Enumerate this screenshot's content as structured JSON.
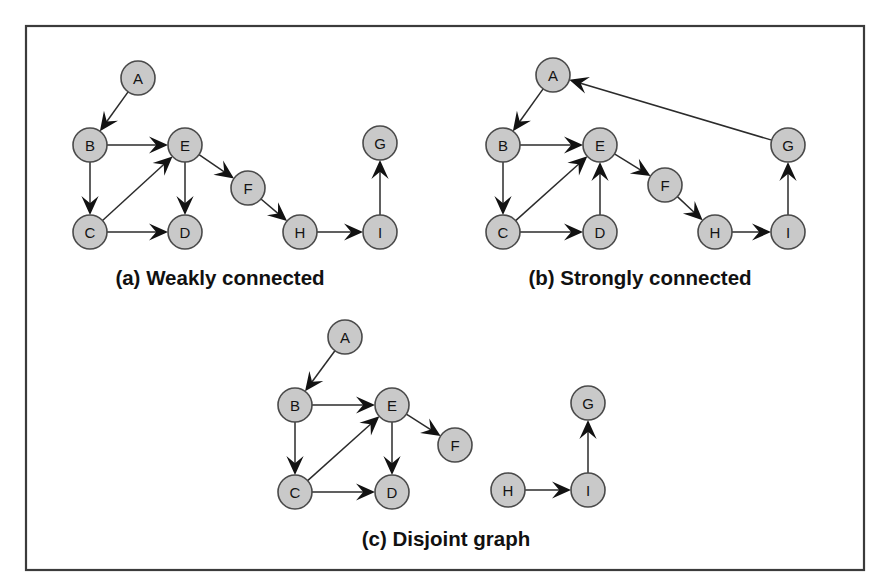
{
  "figure": {
    "kind": "directed-graph-figure",
    "background_color": "#ffffff",
    "frame": {
      "stroke_color": "#3b3b3b",
      "x": 26,
      "y": 26,
      "width": 838,
      "height": 544
    },
    "node_style": {
      "fill_color": "#c9c9c9",
      "stroke_color": "#4a4a4a",
      "radius": 17
    },
    "edge_style": {
      "stroke_color": "#2b2b2b",
      "arrow_fill": "#121212"
    },
    "panels": [
      {
        "id": "panel-a",
        "caption": "(a) Weakly connected",
        "caption_x": 220,
        "caption_y": 285,
        "nodes": [
          {
            "label": "A",
            "x": 138,
            "y": 78
          },
          {
            "label": "B",
            "x": 90,
            "y": 145
          },
          {
            "label": "C",
            "x": 90,
            "y": 232
          },
          {
            "label": "D",
            "x": 185,
            "y": 232
          },
          {
            "label": "E",
            "x": 185,
            "y": 145
          },
          {
            "label": "F",
            "x": 248,
            "y": 188
          },
          {
            "label": "G",
            "x": 380,
            "y": 143
          },
          {
            "label": "H",
            "x": 300,
            "y": 232
          },
          {
            "label": "I",
            "x": 380,
            "y": 232
          }
        ],
        "edges": [
          {
            "from": "A",
            "to": "B"
          },
          {
            "from": "B",
            "to": "E"
          },
          {
            "from": "B",
            "to": "C"
          },
          {
            "from": "C",
            "to": "E"
          },
          {
            "from": "C",
            "to": "D"
          },
          {
            "from": "E",
            "to": "D"
          },
          {
            "from": "E",
            "to": "F"
          },
          {
            "from": "F",
            "to": "H"
          },
          {
            "from": "H",
            "to": "I"
          },
          {
            "from": "I",
            "to": "G"
          }
        ]
      },
      {
        "id": "panel-b",
        "caption": "(b) Strongly connected",
        "caption_x": 640,
        "caption_y": 285,
        "nodes": [
          {
            "label": "A",
            "x": 553,
            "y": 75
          },
          {
            "label": "B",
            "x": 503,
            "y": 145
          },
          {
            "label": "C",
            "x": 503,
            "y": 232
          },
          {
            "label": "D",
            "x": 600,
            "y": 232
          },
          {
            "label": "E",
            "x": 600,
            "y": 145
          },
          {
            "label": "F",
            "x": 665,
            "y": 185
          },
          {
            "label": "G",
            "x": 788,
            "y": 145
          },
          {
            "label": "H",
            "x": 715,
            "y": 232
          },
          {
            "label": "I",
            "x": 788,
            "y": 232
          }
        ],
        "edges": [
          {
            "from": "A",
            "to": "B"
          },
          {
            "from": "B",
            "to": "E"
          },
          {
            "from": "B",
            "to": "C"
          },
          {
            "from": "C",
            "to": "E"
          },
          {
            "from": "C",
            "to": "D"
          },
          {
            "from": "D",
            "to": "E"
          },
          {
            "from": "E",
            "to": "F"
          },
          {
            "from": "F",
            "to": "H"
          },
          {
            "from": "H",
            "to": "I"
          },
          {
            "from": "I",
            "to": "G"
          },
          {
            "from": "G",
            "to": "A"
          }
        ]
      },
      {
        "id": "panel-c",
        "caption": "(c) Disjoint graph",
        "caption_x": 446,
        "caption_y": 546,
        "nodes": [
          {
            "label": "A",
            "x": 345,
            "y": 337
          },
          {
            "label": "B",
            "x": 295,
            "y": 405
          },
          {
            "label": "C",
            "x": 295,
            "y": 492
          },
          {
            "label": "D",
            "x": 392,
            "y": 492
          },
          {
            "label": "E",
            "x": 392,
            "y": 405
          },
          {
            "label": "F",
            "x": 455,
            "y": 445
          },
          {
            "label": "G",
            "x": 588,
            "y": 403
          },
          {
            "label": "H",
            "x": 508,
            "y": 490
          },
          {
            "label": "I",
            "x": 588,
            "y": 490
          }
        ],
        "edges": [
          {
            "from": "A",
            "to": "B"
          },
          {
            "from": "B",
            "to": "E"
          },
          {
            "from": "B",
            "to": "C"
          },
          {
            "from": "C",
            "to": "E"
          },
          {
            "from": "C",
            "to": "D"
          },
          {
            "from": "E",
            "to": "D"
          },
          {
            "from": "E",
            "to": "F"
          },
          {
            "from": "H",
            "to": "I"
          },
          {
            "from": "I",
            "to": "G"
          }
        ]
      }
    ]
  }
}
